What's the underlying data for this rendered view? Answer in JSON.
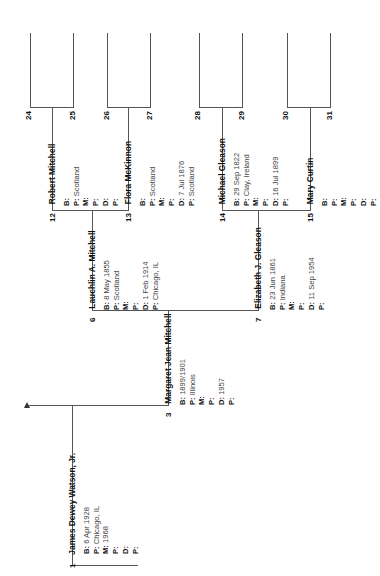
{
  "chart": {
    "type": "pedigree",
    "people": [
      {
        "num": "1",
        "name": "James Dewey Watson, Jr.",
        "fields": [
          [
            "B:",
            "6 Apr 1928"
          ],
          [
            "P:",
            "Chicago, IL"
          ],
          [
            "M:",
            "1968"
          ],
          [
            "P:",
            ""
          ],
          [
            "D:",
            ""
          ],
          [
            "P:",
            ""
          ]
        ]
      },
      {
        "num": "3",
        "name": "Margaret Jean Mitchell",
        "fields": [
          [
            "B:",
            "1899/1901"
          ],
          [
            "P:",
            "Illinois"
          ],
          [
            "M:",
            ""
          ],
          [
            "P:",
            ""
          ],
          [
            "D:",
            "1957"
          ],
          [
            "P:",
            ""
          ]
        ]
      },
      {
        "num": "6",
        "name": "Lauchlin A. Mitchell",
        "fields": [
          [
            "B:",
            "8 May 1855"
          ],
          [
            "P:",
            "Scotland"
          ],
          [
            "M:",
            ""
          ],
          [
            "P:",
            ""
          ],
          [
            "D:",
            "1 Feb 1914"
          ],
          [
            "P:",
            "Chicago, IL"
          ]
        ]
      },
      {
        "num": "7",
        "name": "Elizabeth J. Gleason",
        "fields": [
          [
            "B:",
            "23 Jun 1861"
          ],
          [
            "P:",
            "Indiana"
          ],
          [
            "M:",
            ""
          ],
          [
            "P:",
            ""
          ],
          [
            "D:",
            "11 Sep 1954"
          ],
          [
            "P:",
            ""
          ]
        ]
      },
      {
        "num": "12",
        "name": "Robert Mitchell",
        "fields": [
          [
            "B:",
            ""
          ],
          [
            "P:",
            "Scotland"
          ],
          [
            "M:",
            ""
          ],
          [
            "P:",
            ""
          ],
          [
            "D:",
            ""
          ],
          [
            "P:",
            ""
          ]
        ]
      },
      {
        "num": "13",
        "name": "Flora McKinnon",
        "fields": [
          [
            "B:",
            ""
          ],
          [
            "P:",
            "Scotland"
          ],
          [
            "M:",
            ""
          ],
          [
            "P:",
            ""
          ],
          [
            "D:",
            "7 Jul 1876"
          ],
          [
            "P:",
            "Scotland"
          ]
        ]
      },
      {
        "num": "14",
        "name": "Michael Gleason",
        "fields": [
          [
            "B:",
            "29 Sep 1822"
          ],
          [
            "P:",
            "Clay, Ireland"
          ],
          [
            "M:",
            ""
          ],
          [
            "P:",
            ""
          ],
          [
            "D:",
            "16 Jul 1899"
          ],
          [
            "P:",
            ""
          ]
        ]
      },
      {
        "num": "15",
        "name": "Mary Curtin",
        "fields": [
          [
            "B:",
            ""
          ],
          [
            "P:",
            ""
          ],
          [
            "M:",
            ""
          ],
          [
            "P:",
            ""
          ],
          [
            "D:",
            ""
          ],
          [
            "P:",
            ""
          ]
        ]
      }
    ],
    "empty_slots": [
      "24",
      "25",
      "26",
      "27",
      "28",
      "29",
      "30",
      "31"
    ]
  }
}
